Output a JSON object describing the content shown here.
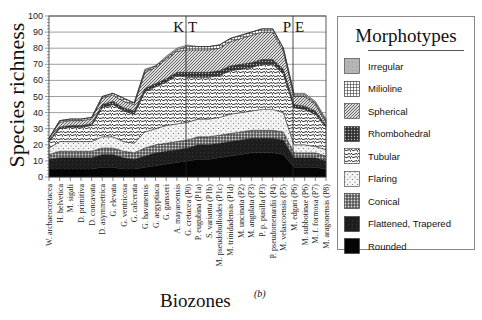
{
  "chart_data": {
    "type": "area",
    "stacked": true,
    "title": "",
    "panel_label": "(b)",
    "xlabel": "Biozones",
    "ylabel": "Species richness",
    "ylim": [
      0,
      100
    ],
    "yticks": [
      0,
      10,
      20,
      30,
      40,
      50,
      60,
      70,
      80,
      90,
      100
    ],
    "grid": true,
    "legend_title": "Morphotypes",
    "legend_position": "right",
    "boundary_markers": [
      {
        "label": "K",
        "label2": "T",
        "after_category": "G. cretacea (P0)",
        "index": 13
      },
      {
        "label": "P",
        "label2": "E",
        "after_category": "M. velascoensis (P5)",
        "index": 22.5
      }
    ],
    "categories": [
      "W. archaeocretacea",
      "H. helvetica",
      "M. sigali",
      "D. primitiva",
      "D. concavata",
      "D. asymmetrica",
      "G. elevata",
      "G. ventricosa",
      "G. calcerata",
      "G. havanensis",
      "G. aegyptiaca",
      "G. gansseri",
      "A. mayaroensis",
      "G. cretacea (P0)",
      "P. eugubina (P1a)",
      "S. varianta (P1b)",
      "M. pseudobulloides (P1c)",
      "M. trinidadensis (P1d)",
      "M. uncinata (P2)",
      "M. angulata (P3)",
      "P. p. pusilla (P3)",
      "P. pseudomenardii (P4)",
      "M. velascoensis (P5)",
      "M. edgari (P6)",
      "M. subbotinae (P6)",
      "M. f. formosa (P7)",
      "M. aragonensis (P8)"
    ],
    "series": [
      {
        "name": "Rounded",
        "values": [
          5,
          5,
          5,
          5,
          5,
          6,
          6,
          5,
          5,
          6,
          7,
          8,
          9,
          10,
          11,
          11,
          12,
          13,
          14,
          15,
          15,
          15,
          14,
          6,
          6,
          6,
          5
        ]
      },
      {
        "name": "Flattened, Trapered",
        "values": [
          6,
          7,
          7,
          7,
          7,
          8,
          8,
          7,
          6,
          7,
          8,
          8,
          8,
          8,
          9,
          9,
          9,
          9,
          9,
          9,
          9,
          9,
          9,
          6,
          6,
          6,
          5
        ]
      },
      {
        "name": "Conical",
        "values": [
          3,
          4,
          4,
          4,
          4,
          4,
          4,
          4,
          4,
          5,
          5,
          5,
          5,
          5,
          5,
          5,
          5,
          5,
          5,
          5,
          5,
          5,
          5,
          3,
          3,
          3,
          3
        ]
      },
      {
        "name": "Flaring",
        "values": [
          4,
          6,
          6,
          6,
          6,
          7,
          7,
          6,
          6,
          10,
          10,
          11,
          11,
          11,
          11,
          11,
          11,
          12,
          12,
          12,
          13,
          13,
          12,
          5,
          5,
          4,
          4
        ]
      },
      {
        "name": "Tubular",
        "values": [
          4,
          8,
          9,
          9,
          10,
          18,
          20,
          19,
          18,
          25,
          26,
          27,
          30,
          28,
          26,
          26,
          26,
          27,
          27,
          27,
          28,
          28,
          24,
          23,
          22,
          20,
          14
        ]
      },
      {
        "name": "Rhombohedral",
        "values": [
          1,
          1,
          1,
          1,
          1,
          2,
          2,
          2,
          2,
          2,
          2,
          2,
          2,
          3,
          3,
          3,
          3,
          3,
          3,
          3,
          3,
          3,
          3,
          2,
          2,
          2,
          1
        ]
      },
      {
        "name": "Spherical",
        "values": [
          1,
          3,
          3,
          3,
          3,
          4,
          4,
          4,
          4,
          10,
          10,
          12,
          13,
          14,
          14,
          14,
          14,
          15,
          16,
          17,
          17,
          17,
          11,
          5,
          6,
          4,
          2
        ]
      },
      {
        "name": "Milioline",
        "values": [
          0,
          1,
          1,
          1,
          1,
          1,
          1,
          2,
          1,
          1,
          1,
          1,
          1,
          2,
          2,
          2,
          2,
          2,
          2,
          2,
          2,
          2,
          2,
          1,
          1,
          1,
          1
        ]
      },
      {
        "name": "Irregular",
        "values": [
          0,
          0,
          0,
          0,
          0,
          0,
          0,
          0,
          0,
          1,
          0,
          1,
          1,
          1,
          0,
          0,
          0,
          0,
          0,
          0,
          0,
          0,
          0,
          1,
          1,
          1,
          1
        ]
      }
    ],
    "totals_approx": [
      24,
      35,
      36,
      36,
      37,
      50,
      52,
      49,
      46,
      67,
      69,
      75,
      80,
      82,
      81,
      81,
      82,
      86,
      88,
      90,
      92,
      92,
      80,
      52,
      52,
      47,
      36
    ]
  },
  "axis": {
    "ylabel": "Species richness",
    "xlabel": "Biozones",
    "panel_label": "(b)",
    "ytick_labels": [
      "0",
      "10",
      "20",
      "30",
      "40",
      "50",
      "60",
      "70",
      "80",
      "90",
      "100"
    ]
  },
  "markers": {
    "kt": {
      "left": "K",
      "right": "T"
    },
    "pe": {
      "left": "P",
      "right": "E"
    }
  },
  "legend": {
    "title": "Morphotypes",
    "items": [
      {
        "label": "Irregular",
        "pattern": "irregular"
      },
      {
        "label": "Milioline",
        "pattern": "milioline"
      },
      {
        "label": "Spherical",
        "pattern": "spherical"
      },
      {
        "label": "Rhombohedral",
        "pattern": "rhombohedral"
      },
      {
        "label": "Tubular",
        "pattern": "tubular"
      },
      {
        "label": "Flaring",
        "pattern": "flaring"
      },
      {
        "label": "Conical",
        "pattern": "conical"
      },
      {
        "label": "Flattened, Trapered",
        "pattern": "flattened"
      },
      {
        "label": "Rounded",
        "pattern": "rounded"
      }
    ]
  }
}
